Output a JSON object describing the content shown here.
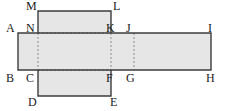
{
  "figure": {
    "name": "box-net-diagram",
    "type": "geometry-net",
    "background_color": "#ffffff",
    "fill_color": "#e6e6e6",
    "stroke_color": "#3c3c3c",
    "dash_color": "#8c8c8c",
    "label_color": "#1a1a1a",
    "width": 227,
    "height": 111
  },
  "geometry": {
    "horizontal_band": {
      "name": "horizontal-strip",
      "left": 18,
      "right": 211,
      "top": 33,
      "bottom": 70
    },
    "vertical_band": {
      "name": "vertical-strip",
      "left": 38,
      "right": 111,
      "top": 11,
      "bottom": 96
    },
    "fold_lines": {
      "vertical_x": [
        38,
        111,
        134
      ],
      "horizontal_y": [
        33,
        70
      ]
    }
  },
  "labels": [
    {
      "id": "A",
      "text": "A",
      "x": 6,
      "y": 22
    },
    {
      "id": "M",
      "text": "M",
      "x": 26,
      "y": 0
    },
    {
      "id": "N",
      "text": "N",
      "x": 26,
      "y": 22
    },
    {
      "id": "L",
      "text": "L",
      "x": 113,
      "y": 0
    },
    {
      "id": "K",
      "text": "K",
      "x": 106,
      "y": 22
    },
    {
      "id": "J",
      "text": "J",
      "x": 126,
      "y": 22
    },
    {
      "id": "I",
      "text": "I",
      "x": 208,
      "y": 22
    },
    {
      "id": "B",
      "text": "B",
      "x": 6,
      "y": 72
    },
    {
      "id": "C",
      "text": "C",
      "x": 26,
      "y": 72
    },
    {
      "id": "F",
      "text": "F",
      "x": 106,
      "y": 72
    },
    {
      "id": "G",
      "text": "G",
      "x": 126,
      "y": 72
    },
    {
      "id": "H",
      "text": "H",
      "x": 206,
      "y": 72
    },
    {
      "id": "D",
      "text": "D",
      "x": 28,
      "y": 96
    },
    {
      "id": "E",
      "text": "E",
      "x": 110,
      "y": 96
    }
  ]
}
